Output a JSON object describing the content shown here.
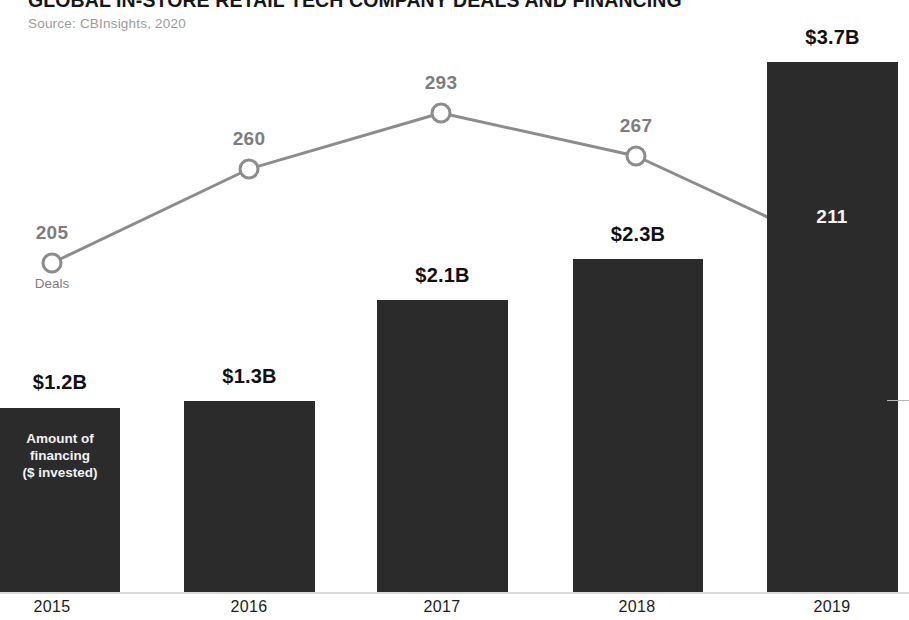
{
  "header": {
    "title": "GLOBAL IN-STORE RETAIL TECH COMPANY DEALS AND FINANCING",
    "source": "Source: CBInsights, 2020"
  },
  "labels": {
    "bar_series_caption": "Amount of\nfinancing\n($ invested)",
    "line_series_caption": "Deals"
  },
  "chart_data": {
    "type": "bar",
    "title": "GLOBAL IN-STORE RETAIL TECH COMPANY DEALS AND FINANCING",
    "subtitle": "Source: CBInsights, 2020",
    "categories": [
      "2015",
      "2016",
      "2017",
      "2018",
      "2019"
    ],
    "xlabel": "",
    "ylabel": "",
    "grid": false,
    "legend_position": "inline-annotations",
    "series": [
      {
        "name": "Amount of financing ($ invested)",
        "type": "bar",
        "color": "#2b2b2b",
        "unit": "$B",
        "values": [
          1.2,
          1.3,
          2.1,
          2.3,
          3.7
        ],
        "labels": [
          "$1.2B",
          "$1.3B",
          "$2.1B",
          "$2.3B",
          "$3.7B"
        ]
      },
      {
        "name": "Deals",
        "type": "line",
        "color": "#8c8c8c",
        "unit": "deals",
        "values": [
          205,
          260,
          293,
          267,
          211
        ],
        "labels": [
          "205",
          "260",
          "293",
          "267",
          "211"
        ]
      }
    ]
  },
  "geometry": {
    "bars": [
      {
        "x": 0,
        "w": 120,
        "top": 408,
        "label_x": 0,
        "label_w": 120,
        "label_y": 371
      },
      {
        "x": 184,
        "w": 131,
        "top": 401,
        "label_x": 184,
        "label_w": 131,
        "label_y": 365
      },
      {
        "x": 377,
        "w": 131,
        "top": 300,
        "label_x": 377,
        "label_w": 131,
        "label_y": 264
      },
      {
        "x": 573,
        "w": 130,
        "top": 259,
        "label_x": 573,
        "label_w": 130,
        "label_y": 223
      },
      {
        "x": 767,
        "w": 131,
        "top": 62,
        "label_x": 767,
        "label_w": 131,
        "label_y": 26
      }
    ],
    "bar_bottom": 592,
    "points": [
      {
        "x": 52,
        "y": 263,
        "label_y": 222,
        "on_dark": false
      },
      {
        "x": 249,
        "y": 169,
        "label_y": 128,
        "on_dark": false
      },
      {
        "x": 441,
        "y": 113,
        "label_y": 72,
        "on_dark": false
      },
      {
        "x": 636,
        "y": 156,
        "label_y": 115,
        "on_dark": false
      },
      {
        "x": 832,
        "y": 247,
        "label_y": 206,
        "on_dark": true
      }
    ],
    "ticks": [
      {
        "x": 52
      },
      {
        "x": 249
      },
      {
        "x": 442
      },
      {
        "x": 637
      },
      {
        "x": 832
      }
    ]
  },
  "colors": {
    "bar": "#2b2b2b",
    "line": "#8c8c8c",
    "text_dark": "#111111",
    "text_light": "#f2f2f2",
    "muted": "#9b9b9b",
    "background": "#ffffff"
  }
}
